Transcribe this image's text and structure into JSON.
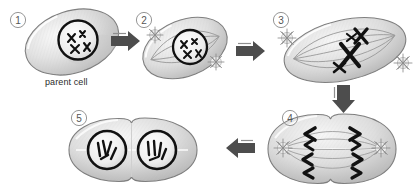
{
  "diagram": {
    "background_color": "#ffffff",
    "labels": {
      "parent_cell": "parent cell"
    },
    "palette": {
      "cytoplasm_light": "#f2f2f2",
      "cytoplasm_mid": "#d9d9d9",
      "cytoplasm_dark": "#b3b3b3",
      "outline": "#7a7a7a",
      "chromosome": "#111111",
      "arrow": "#4d4d4d",
      "number_text": "#555555"
    },
    "stages": [
      {
        "number": "1",
        "name": "parent-cell",
        "caption": "parent cell",
        "chromosome_count": 4,
        "has_nucleus": true,
        "has_spindle": false,
        "has_centrosomes": false,
        "cleavage": false
      },
      {
        "number": "2",
        "name": "prophase",
        "caption": "",
        "chromosome_count": 4,
        "has_nucleus": true,
        "has_spindle": true,
        "has_centrosomes": true,
        "cleavage": false
      },
      {
        "number": "3",
        "name": "metaphase",
        "caption": "",
        "chromosome_count": 2,
        "has_nucleus": false,
        "has_spindle": true,
        "has_centrosomes": true,
        "cleavage": false
      },
      {
        "number": "4",
        "name": "anaphase",
        "caption": "",
        "chromosome_count": 8,
        "has_nucleus": false,
        "has_spindle": true,
        "has_centrosomes": true,
        "cleavage": true
      },
      {
        "number": "5",
        "name": "daughter-cells",
        "caption": "",
        "chromosome_count": 8,
        "has_nucleus": true,
        "has_spindle": false,
        "has_centrosomes": false,
        "cleavage": true
      }
    ],
    "arrows": [
      {
        "name": "arrow-1-to-2",
        "direction": "right"
      },
      {
        "name": "arrow-2-to-3",
        "direction": "right"
      },
      {
        "name": "arrow-3-to-4",
        "direction": "down"
      },
      {
        "name": "arrow-4-to-5",
        "direction": "left"
      }
    ]
  }
}
